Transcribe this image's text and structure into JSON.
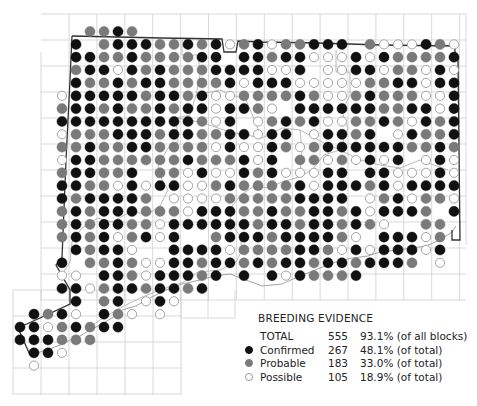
{
  "map": {
    "kind": "atlas-breeding-evidence-dot-map",
    "states": {
      "C": {
        "name": "Confirmed",
        "fill": "#111111",
        "stroke": "#111111"
      },
      "P": {
        "name": "Probable",
        "fill": "#7a7a7a",
        "stroke": "#7a7a7a"
      },
      "S": {
        "name": "Possible",
        "fill": "#ffffff",
        "stroke": "#9a9a9a"
      }
    },
    "grid_note": "Each row string lists dot codes from start_col; '.' = no record.",
    "rows": [
      {
        "row": 0,
        "start_col": 2,
        "cells": "PPCP"
      },
      {
        "row": 1,
        "start_col": 1,
        "cells": "C.PCCCPPCPCSPCSPPCCC.PSSSCPS"
      },
      {
        "row": 2,
        "start_col": 1,
        "cells": "CCPPCPPPPCC.CCPCCSSSCSCPPPPC"
      },
      {
        "row": 3,
        "start_col": 1,
        "cells": "PCCSCPCPPPCCCCSSC.SSCCSPPSCS"
      },
      {
        "row": 4,
        "start_col": 1,
        "cells": "CPPCPCCPPPPCSCCCSSSSSPPCCSCC"
      },
      {
        "row": 5,
        "start_col": 0,
        "cells": "SCCCCCPCCPCSSPPPPCPSSPCPPPSSC"
      },
      {
        "row": 6,
        "start_col": 0,
        "cells": "PCCPCPPCPCCSCCPS.CCCCCCPPCCSC"
      },
      {
        "row": 7,
        "start_col": 0,
        "cells": "CCCCCCCCCCPSC.SPCPCSSPPCPSCPC"
      },
      {
        "row": 8,
        "start_col": 0,
        "cells": "SPPPCCCPCCPPCCSCC.SCCPC.SCPPC"
      },
      {
        "row": 9,
        "start_col": 0,
        "cells": "PPCPPCCPPPPSCSSCPSPCCCCCCPPCP"
      },
      {
        "row": 10,
        "start_col": 0,
        "cells": "SCCPPPPPPCPPPCSC.PPSPSCSC.SCS"
      },
      {
        "row": 11,
        "start_col": 0,
        "cells": "PCCPPC.PPSCSSCPCSSSCC.CCSSSCS"
      },
      {
        "row": 12,
        "start_col": 0,
        "cells": "CCPPSCSCCSSPCPPPPCSCCCPCSCCCC"
      },
      {
        "row": 13,
        "start_col": 0,
        "cells": "CPCCCCP.SSSSPPPPPCCCC.SPCSPPS"
      },
      {
        "row": 14,
        "start_col": 0,
        "cells": "PCPCCCPPPSCCCPPCPPCCPCSCCCP.C"
      },
      {
        "row": 15,
        "start_col": 0,
        "cells": "PCPCCPPSCCCCCCPCCPCCPCPS..PP"
      },
      {
        "row": 16,
        "start_col": 0,
        "cells": "PCPCSPCSC..PCCCPCCCCPS.CCCSP"
      },
      {
        "row": 17,
        "start_col": 1,
        "cells": "CPCCS..CCCCSPPPPCCPSCSCCCSC"
      },
      {
        "row": 18,
        "start_col": 0,
        "cells": "C.PPCPSSCCPCCPCPCCPCCPCCCP.S"
      },
      {
        "row": 19,
        "start_col": 0,
        "cells": "SS.CCPSCCCPC.C.CSCPPPC"
      },
      {
        "row": 20,
        "start_col": 0,
        "cells": "CCSPCCPCCPC"
      },
      {
        "row": 21,
        "start_col": 1,
        "cells": "C.PC.SCS"
      },
      {
        "row": 22,
        "start_col": -2,
        "cells": "CPCS.CPS.S"
      },
      {
        "row": 23,
        "start_col": -3,
        "cells": "CCSPCPCC"
      },
      {
        "row": 24,
        "start_col": -3,
        "cells": "CCCPPP"
      },
      {
        "row": 25,
        "start_col": -2,
        "cells": "CCS"
      },
      {
        "row": 26,
        "start_col": -2,
        "cells": "S"
      }
    ]
  },
  "legend": {
    "title": "BREEDING EVIDENCE",
    "rows": [
      {
        "key": "total",
        "label": "TOTAL",
        "count": "555",
        "percent": "93.1% (of all blocks)",
        "swatch": null
      },
      {
        "key": "confirmed",
        "label": "Confirmed",
        "count": "267",
        "percent": "48.1% (of total)",
        "swatch": "C"
      },
      {
        "key": "probable",
        "label": "Probable",
        "count": "183",
        "percent": "33.0% (of total)",
        "swatch": "P"
      },
      {
        "key": "possible",
        "label": "Possible",
        "count": "105",
        "percent": "18.9% (of total)",
        "swatch": "S"
      }
    ]
  }
}
